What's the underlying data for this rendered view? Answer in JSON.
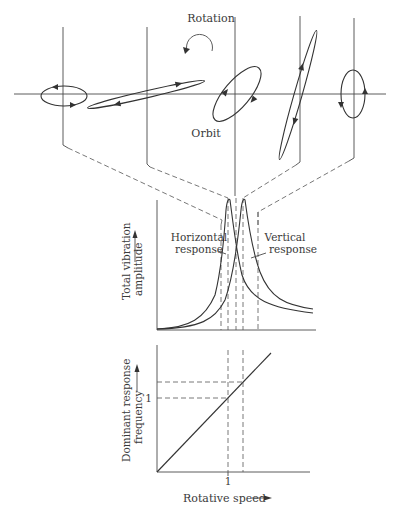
{
  "diagram": {
    "top_panel": {
      "rotation_label": "Rotation",
      "orbit_label": "Orbit",
      "orbits": [
        {
          "id": "orbit-1",
          "shape": "horizontal ellipse"
        },
        {
          "id": "orbit-2",
          "shape": "thin inclined ellipse"
        },
        {
          "id": "orbit-3",
          "shape": "inclined ellipse"
        },
        {
          "id": "orbit-4",
          "shape": "thin steep ellipse"
        },
        {
          "id": "orbit-5",
          "shape": "vertical ellipse"
        }
      ]
    },
    "middle_chart": {
      "ylabel_line1": "Total vibration",
      "ylabel_line2": "amplitude",
      "horizontal_label_line1": "Horizontal",
      "horizontal_label_line2": "response",
      "vertical_label_line1": "Vertical",
      "vertical_label_line2": "response"
    },
    "bottom_chart": {
      "ylabel_line1": "Dominant response",
      "ylabel_line2": "frequency",
      "xlabel": "Rotative speed",
      "x_tick": "1",
      "y_tick": "1"
    }
  },
  "colors": {
    "line": "#4a4a4a",
    "background": "#ffffff"
  }
}
